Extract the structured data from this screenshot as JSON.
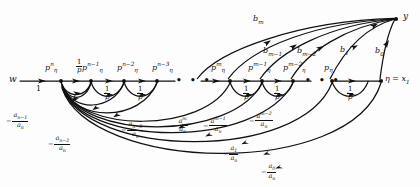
{
  "figure": {
    "type": "signal-flow-graph",
    "stroke_color": "#111111",
    "background": "#fdfdfd"
  },
  "nodes": {
    "source_label": "w",
    "sink_label": "y",
    "terminal_label": "η = x",
    "terminal_sub": "1",
    "chain": [
      {
        "id": "n0",
        "label": "p",
        "sup": "n",
        "tail": "η"
      },
      {
        "id": "n1",
        "label": "p",
        "sup": "n−1",
        "tail": "η"
      },
      {
        "id": "n2",
        "label": "p",
        "sup": "n−2",
        "tail": "η"
      },
      {
        "id": "n3",
        "label": "p",
        "sup": "n−3",
        "tail": "η"
      },
      {
        "id": "n4",
        "label": "p",
        "sup": "m",
        "tail": "η"
      },
      {
        "id": "n5",
        "label": "p",
        "sup": "m−1",
        "tail": "η"
      },
      {
        "id": "n6",
        "label": "p",
        "sup": "m−2",
        "tail": "η"
      },
      {
        "id": "n7",
        "label": "p",
        "sup": "",
        "tail": "η"
      }
    ]
  },
  "edge_weights": {
    "input_gain": "1",
    "chain_gain_num": "1",
    "chain_gain_den": "p",
    "chain_gain_count": 7
  },
  "feedback_arcs": [
    {
      "id": "fb-n-1",
      "sign": "−",
      "num": "a",
      "num_sub": "n−1",
      "den": "a",
      "den_sub": "n"
    },
    {
      "id": "fb-n-2",
      "sign": "−",
      "num": "a",
      "num_sub": "n−2",
      "den": "a",
      "den_sub": "n"
    },
    {
      "id": "fb-n-3",
      "sign": "−",
      "num": "a",
      "num_sub": "n−3",
      "den": "a",
      "den_sub": "n"
    },
    {
      "id": "fb-m",
      "sign": "−",
      "num": "a",
      "num_sup": "m",
      "den": "a",
      "den_sub": "n"
    },
    {
      "id": "fb-m-1",
      "sign": "−",
      "num": "a",
      "num_sup": "m−1",
      "den": "a",
      "den_sub": "n"
    },
    {
      "id": "fb-m-2",
      "sign": "−",
      "num": "a",
      "num_sup": "m−2",
      "den": "a",
      "den_sub": "n"
    },
    {
      "id": "fb-1",
      "sign": "−",
      "num": "a",
      "num_sub": "1",
      "den": "a",
      "den_sub": "n"
    },
    {
      "id": "fb-0",
      "sign": "−",
      "num": "a",
      "num_sub": "0",
      "den": "a",
      "den_sub": "n"
    }
  ],
  "output_arcs": [
    {
      "id": "b-m",
      "label": "b",
      "sub": "m"
    },
    {
      "id": "b-m-1",
      "label": "b",
      "sub": "m−1"
    },
    {
      "id": "b-m-2",
      "label": "b",
      "sub": "m−2"
    },
    {
      "id": "b-1",
      "label": "b",
      "sub": "1"
    },
    {
      "id": "b-0",
      "label": "b",
      "sub": "0"
    }
  ],
  "ellipses": {
    "left": "• • •",
    "right": "• • •"
  }
}
